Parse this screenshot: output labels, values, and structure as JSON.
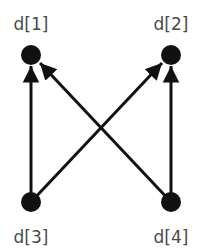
{
  "diagram": {
    "nodes": [
      {
        "id": "d1",
        "label": "d[1]",
        "x": 31,
        "y": 55,
        "label_x": 31,
        "label_y": 30
      },
      {
        "id": "d2",
        "label": "d[2]",
        "x": 171,
        "y": 55,
        "label_x": 171,
        "label_y": 30
      },
      {
        "id": "d3",
        "label": "d[3]",
        "x": 31,
        "y": 202,
        "label_x": 31,
        "label_y": 243
      },
      {
        "id": "d4",
        "label": "d[4]",
        "x": 171,
        "y": 202,
        "label_x": 171,
        "label_y": 243
      }
    ],
    "edges": [
      {
        "from": "d3",
        "to": "d1"
      },
      {
        "from": "d4",
        "to": "d1"
      },
      {
        "from": "d3",
        "to": "d2"
      },
      {
        "from": "d4",
        "to": "d2"
      }
    ],
    "colors": {
      "node": "#111111",
      "edge": "#111111",
      "label": "#4a4a4a"
    }
  }
}
